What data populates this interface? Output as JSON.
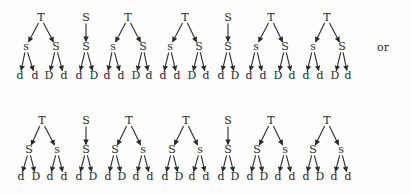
{
  "diagram": {
    "separator_label": "or",
    "separator_pos": {
      "x": 383,
      "y": 48
    },
    "rows": [
      {
        "name": "row-1",
        "levels_y": [
          18,
          47,
          76
        ],
        "trees": [
          {
            "root": {
              "label": "T",
              "x": 41
            },
            "children": [
              {
                "label": "s",
                "x": 26,
                "leaves": [
                  {
                    "label": "d",
                    "x": 20
                  },
                  {
                    "label": "d",
                    "x": 35
                  }
                ]
              },
              {
                "label": "S",
                "x": 56,
                "leaves": [
                  {
                    "label": "D",
                    "x": 49
                  },
                  {
                    "label": "d",
                    "x": 64
                  }
                ]
              }
            ]
          },
          {
            "root": {
              "label": "S",
              "x": 86
            },
            "children": [
              {
                "label": "S",
                "x": 86,
                "leaves": [
                  {
                    "label": "d",
                    "x": 79
                  },
                  {
                    "label": "D",
                    "x": 94
                  }
                ]
              }
            ]
          },
          {
            "root": {
              "label": "T",
              "x": 128
            },
            "children": [
              {
                "label": "s",
                "x": 113,
                "leaves": [
                  {
                    "label": "d",
                    "x": 107
                  },
                  {
                    "label": "d",
                    "x": 121
                  }
                ]
              },
              {
                "label": "S",
                "x": 143,
                "leaves": [
                  {
                    "label": "D",
                    "x": 136
                  },
                  {
                    "label": "d",
                    "x": 149
                  }
                ]
              }
            ]
          },
          {
            "root": {
              "label": "T",
              "x": 185
            },
            "children": [
              {
                "label": "s",
                "x": 170,
                "leaves": [
                  {
                    "label": "d",
                    "x": 163
                  },
                  {
                    "label": "d",
                    "x": 177
                  }
                ]
              },
              {
                "label": "S",
                "x": 199,
                "leaves": [
                  {
                    "label": "D",
                    "x": 192
                  },
                  {
                    "label": "d",
                    "x": 206
                  }
                ]
              }
            ]
          },
          {
            "root": {
              "label": "S",
              "x": 228
            },
            "children": [
              {
                "label": "S",
                "x": 228,
                "leaves": [
                  {
                    "label": "d",
                    "x": 221
                  },
                  {
                    "label": "D",
                    "x": 235
                  }
                ]
              }
            ]
          },
          {
            "root": {
              "label": "T",
              "x": 271
            },
            "children": [
              {
                "label": "s",
                "x": 256,
                "leaves": [
                  {
                    "label": "d",
                    "x": 249
                  },
                  {
                    "label": "d",
                    "x": 263
                  }
                ]
              },
              {
                "label": "S",
                "x": 285,
                "leaves": [
                  {
                    "label": "D",
                    "x": 278
                  },
                  {
                    "label": "d",
                    "x": 292
                  }
                ]
              }
            ]
          },
          {
            "root": {
              "label": "T",
              "x": 327
            },
            "children": [
              {
                "label": "s",
                "x": 313,
                "leaves": [
                  {
                    "label": "d",
                    "x": 306
                  },
                  {
                    "label": "d",
                    "x": 320
                  }
                ]
              },
              {
                "label": "S",
                "x": 342,
                "leaves": [
                  {
                    "label": "D",
                    "x": 335
                  },
                  {
                    "label": "d",
                    "x": 348
                  }
                ]
              }
            ]
          }
        ]
      },
      {
        "name": "row-2",
        "levels_y": [
          121,
          150,
          177
        ],
        "trees": [
          {
            "root": {
              "label": "T",
              "x": 42
            },
            "children": [
              {
                "label": "S",
                "x": 29,
                "leaves": [
                  {
                    "label": "d",
                    "x": 21
                  },
                  {
                    "label": "D",
                    "x": 36
                  }
                ]
              },
              {
                "label": "s",
                "x": 57,
                "leaves": [
                  {
                    "label": "d",
                    "x": 50
                  },
                  {
                    "label": "d",
                    "x": 64
                  }
                ]
              }
            ]
          },
          {
            "root": {
              "label": "S",
              "x": 86
            },
            "children": [
              {
                "label": "S",
                "x": 86,
                "leaves": [
                  {
                    "label": "d",
                    "x": 79
                  },
                  {
                    "label": "D",
                    "x": 93
                  }
                ]
              }
            ]
          },
          {
            "root": {
              "label": "T",
              "x": 129
            },
            "children": [
              {
                "label": "S",
                "x": 115,
                "leaves": [
                  {
                    "label": "d",
                    "x": 108
                  },
                  {
                    "label": "D",
                    "x": 122
                  }
                ]
              },
              {
                "label": "s",
                "x": 143,
                "leaves": [
                  {
                    "label": "d",
                    "x": 136
                  },
                  {
                    "label": "d",
                    "x": 150
                  }
                ]
              }
            ]
          },
          {
            "root": {
              "label": "T",
              "x": 186
            },
            "children": [
              {
                "label": "S",
                "x": 172,
                "leaves": [
                  {
                    "label": "d",
                    "x": 165
                  },
                  {
                    "label": "D",
                    "x": 179
                  }
                ]
              },
              {
                "label": "s",
                "x": 200,
                "leaves": [
                  {
                    "label": "d",
                    "x": 192
                  },
                  {
                    "label": "d",
                    "x": 206
                  }
                ]
              }
            ]
          },
          {
            "root": {
              "label": "S",
              "x": 228
            },
            "children": [
              {
                "label": "S",
                "x": 228,
                "leaves": [
                  {
                    "label": "d",
                    "x": 221
                  },
                  {
                    "label": "D",
                    "x": 235
                  }
                ]
              }
            ]
          },
          {
            "root": {
              "label": "T",
              "x": 271
            },
            "children": [
              {
                "label": "S",
                "x": 257,
                "leaves": [
                  {
                    "label": "d",
                    "x": 250
                  },
                  {
                    "label": "D",
                    "x": 264
                  }
                ]
              },
              {
                "label": "s",
                "x": 285,
                "leaves": [
                  {
                    "label": "d",
                    "x": 278
                  },
                  {
                    "label": "d",
                    "x": 292
                  }
                ]
              }
            ]
          },
          {
            "root": {
              "label": "T",
              "x": 327
            },
            "children": [
              {
                "label": "S",
                "x": 313,
                "leaves": [
                  {
                    "label": "d",
                    "x": 306
                  },
                  {
                    "label": "D",
                    "x": 320
                  }
                ]
              },
              {
                "label": "s",
                "x": 341,
                "leaves": [
                  {
                    "label": "d",
                    "x": 334
                  },
                  {
                    "label": "d",
                    "x": 348
                  }
                ]
              }
            ]
          }
        ]
      }
    ]
  }
}
